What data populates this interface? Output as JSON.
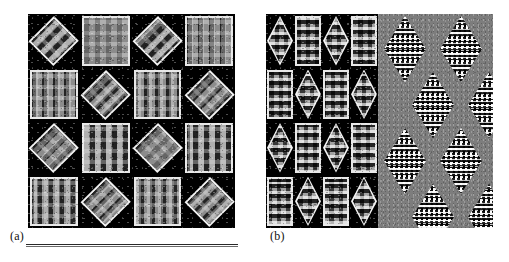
{
  "figure": {
    "caption_labels": {
      "panel_a": "(a)",
      "panel_b": "(b)"
    },
    "background_color": "#ffffff",
    "panel_background_color": "#000000",
    "noise_field_color": "#7d7d7d",
    "tile_border_color": "#e8e8e8",
    "panels": [
      {
        "id": "a",
        "label": "(a)",
        "rect": {
          "x": 28,
          "y": 14,
          "width": 207,
          "height": 214
        },
        "grid": {
          "rows": 4,
          "cols": 4
        },
        "description": "Black field tiled by a 4x4 checkerboard alternation of white-outlined diamond (45-degree rotated) checker patches and upright square checker patches.",
        "tile_kinds": [
          "diamond",
          "square"
        ],
        "tile_layout": [
          [
            "diamond",
            "square",
            "diamond",
            "square"
          ],
          [
            "square",
            "diamond",
            "square",
            "diamond"
          ],
          [
            "diamond",
            "square",
            "diamond",
            "square"
          ],
          [
            "square",
            "diamond",
            "square",
            "diamond"
          ]
        ]
      },
      {
        "id": "b",
        "label": "(b)",
        "rect": {
          "x": 266,
          "y": 14,
          "width": 227,
          "height": 214
        },
        "sections": [
          {
            "id": "b-tiles",
            "rect": {
              "x": 0,
              "y": 0,
              "width": 112,
              "height": 214
            },
            "grid": {
              "rows": 4,
              "cols": 4
            },
            "description": "Black field tiled by a 4x4 checkerboard alternation of white-outlined vertical lozenge (rhombus) patches and upright rectangular checker patches.",
            "tile_kinds": [
              "lozenge",
              "rect"
            ],
            "tile_layout": [
              [
                "lozenge",
                "rect",
                "lozenge",
                "rect"
              ],
              [
                "rect",
                "lozenge",
                "rect",
                "lozenge"
              ],
              [
                "lozenge",
                "rect",
                "lozenge",
                "rect"
              ],
              [
                "rect",
                "lozenge",
                "rect",
                "lozenge"
              ]
            ]
          },
          {
            "id": "b-noise",
            "rect": {
              "x": 112,
              "y": 0,
              "width": 115,
              "height": 214
            },
            "description": "Uniform mid-grey noise field containing black-and-white dotted vertical lozenges arranged on an offset (staggered) lattice, two per row.",
            "lozenge_count": 8,
            "lozenge_size": {
              "width": 42,
              "height": 66
            },
            "lozenge_positions": [
              {
                "x": 6,
                "y": 2
              },
              {
                "x": 62,
                "y": 2
              },
              {
                "x": 34,
                "y": 58
              },
              {
                "x": 90,
                "y": 58
              },
              {
                "x": 6,
                "y": 114
              },
              {
                "x": 62,
                "y": 114
              },
              {
                "x": 34,
                "y": 170
              },
              {
                "x": 90,
                "y": 170
              }
            ]
          }
        ]
      }
    ],
    "rule": {
      "x": 26,
      "y": 244,
      "width": 212
    }
  }
}
